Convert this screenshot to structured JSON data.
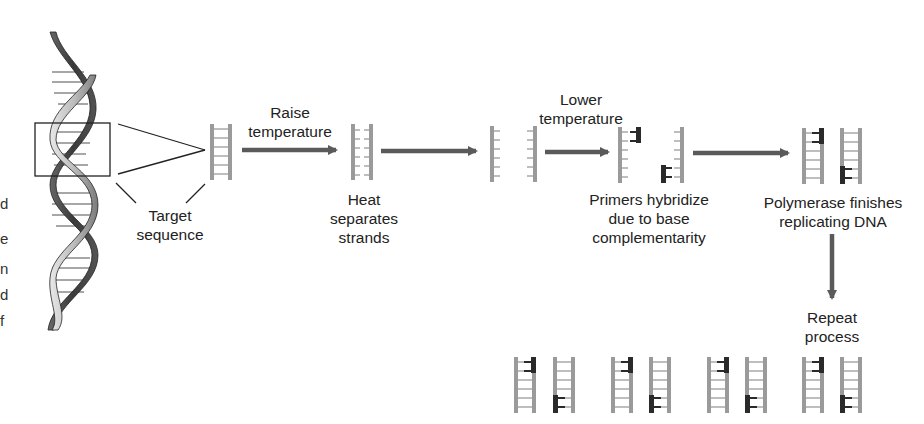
{
  "diagram": {
    "type": "process-flow",
    "colors": {
      "arrow": "#5a5a5a",
      "strand": "#9a9a9a",
      "primer": "#2a2a2a",
      "text": "#222222",
      "helix_dark": "#4a4a4a",
      "helix_light": "#bdbdbd"
    },
    "left_edge_fragments": [
      "d",
      "e",
      "n",
      "d",
      "f"
    ],
    "labels": {
      "target": [
        "Target",
        "sequence"
      ],
      "raise_temp": [
        "Raise",
        "temperature"
      ],
      "heat": [
        "Heat",
        "separates",
        "strands"
      ],
      "lower_temp": [
        "Lower",
        "temperature"
      ],
      "primers": [
        "Primers hybridize",
        "due to base",
        "complementarity"
      ],
      "polymerase": [
        "Polymerase finishes",
        "replicating DNA"
      ],
      "repeat": [
        "Repeat",
        "process"
      ]
    },
    "nodes": [
      {
        "id": "dna-helix",
        "label": "Double helix DNA"
      },
      {
        "id": "target-sequence",
        "label": "Target sequence"
      },
      {
        "id": "heated",
        "label": "Heat separates strands"
      },
      {
        "id": "separated",
        "label": "Single strands"
      },
      {
        "id": "primed",
        "label": "Primers hybridize due to base complementarity"
      },
      {
        "id": "replicated",
        "label": "Polymerase finishes replicating DNA"
      },
      {
        "id": "amplified",
        "label": "Repeat process (4 copies pairs)"
      }
    ],
    "edges": [
      {
        "from": "target-sequence",
        "to": "heated",
        "label": "Raise temperature"
      },
      {
        "from": "heated",
        "to": "separated",
        "label": ""
      },
      {
        "from": "separated",
        "to": "primed",
        "label": "Lower temperature"
      },
      {
        "from": "primed",
        "to": "replicated",
        "label": ""
      },
      {
        "from": "replicated",
        "to": "amplified",
        "label": "Repeat process"
      }
    ]
  }
}
